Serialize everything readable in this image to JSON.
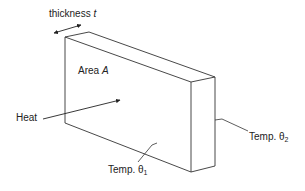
{
  "labels": {
    "thickness": "thickness ",
    "thickness_symbol": "t",
    "area": "Area ",
    "area_symbol": "A",
    "heat": "Heat",
    "temp1": "Temp. θ",
    "temp1_sub": "1",
    "temp2": "Temp. θ",
    "temp2_sub": "2"
  },
  "colors": {
    "line": "#333333",
    "text": "#222222",
    "background": "#ffffff"
  }
}
